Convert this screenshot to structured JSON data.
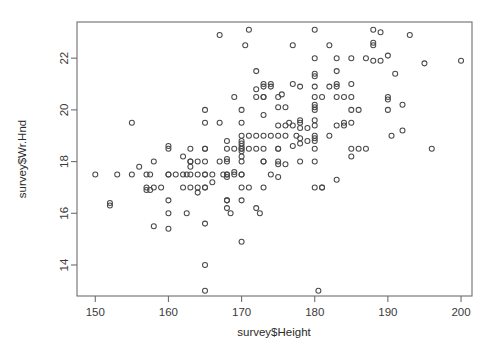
{
  "chart_data": {
    "type": "scatter",
    "title": "",
    "xlabel": "survey$Height",
    "ylabel": "survey$Wr.Hnd",
    "xlim": [
      147.5,
      201.5
    ],
    "ylim": [
      12.8,
      23.4
    ],
    "xticks": [
      150,
      160,
      170,
      180,
      190,
      200
    ],
    "yticks": [
      14,
      16,
      18,
      20,
      22
    ],
    "xtick_labels": [
      "150",
      "160",
      "170",
      "180",
      "190",
      "200"
    ],
    "ytick_labels": [
      "14",
      "16",
      "18",
      "20",
      "22"
    ],
    "grid": false,
    "legend": false,
    "marker": "open-circle",
    "marker_size_px": 5.0,
    "marker_color": "#4a4a4a",
    "n_points": 206,
    "x": [
      150.0,
      152.0,
      152.0,
      153.0,
      155.0,
      155.0,
      156.0,
      157.0,
      157.0,
      157.0,
      157.5,
      157.5,
      158.0,
      158.0,
      158.0,
      159.0,
      160.0,
      160.0,
      160.0,
      160.0,
      160.0,
      160.0,
      160.0,
      161.0,
      162.0,
      162.0,
      162.0,
      162.5,
      162.5,
      163.0,
      163.0,
      163.0,
      163.0,
      163.0,
      163.0,
      164.0,
      164.0,
      164.0,
      164.0,
      165.0,
      165.0,
      165.0,
      165.0,
      165.0,
      165.0,
      165.0,
      165.0,
      165.0,
      165.0,
      165.0,
      165.0,
      166.0,
      166.0,
      167.0,
      167.0,
      167.0,
      167.5,
      168.0,
      168.0,
      168.0,
      168.0,
      168.0,
      168.0,
      168.0,
      168.0,
      168.0,
      168.0,
      168.5,
      169.0,
      169.0,
      169.0,
      169.0,
      170.0,
      170.0,
      170.0,
      170.0,
      170.0,
      170.0,
      170.0,
      170.0,
      170.0,
      170.0,
      170.0,
      170.0,
      170.0,
      170.0,
      170.0,
      170.0,
      170.5,
      171.0,
      171.0,
      171.0,
      171.0,
      172.0,
      172.0,
      172.0,
      172.0,
      172.0,
      172.5,
      173.0,
      173.0,
      173.0,
      173.0,
      173.0,
      173.0,
      173.0,
      173.0,
      173.0,
      173.0,
      174.0,
      174.0,
      174.0,
      175.0,
      175.0,
      175.0,
      175.0,
      175.0,
      175.0,
      175.0,
      175.0,
      175.0,
      175.5,
      176.0,
      176.0,
      176.0,
      176.5,
      177.0,
      177.0,
      177.0,
      177.0,
      177.5,
      178.0,
      178.0,
      178.0,
      178.0,
      178.0,
      178.0,
      179.0,
      179.0,
      180.0,
      180.0,
      180.0,
      180.0,
      180.0,
      180.0,
      180.0,
      180.0,
      180.0,
      180.0,
      180.0,
      180.0,
      180.0,
      180.0,
      180.0,
      180.0,
      180.0,
      180.5,
      181.0,
      181.0,
      182.0,
      182.0,
      182.0,
      183.0,
      183.0,
      183.0,
      183.0,
      183.0,
      183.0,
      183.0,
      184.0,
      184.0,
      184.0,
      185.0,
      185.0,
      185.0,
      185.0,
      185.0,
      185.0,
      185.0,
      186.0,
      186.0,
      187.0,
      187.0,
      188.0,
      188.0,
      188.0,
      188.0,
      189.0,
      189.0,
      190.0,
      190.0,
      190.0,
      190.0,
      190.5,
      191.0,
      192.0,
      192.0,
      193.0,
      195.0,
      196.0,
      200.0,
      172.0,
      174.0,
      176.0,
      178.0,
      181.0
    ],
    "y": [
      17.5,
      16.3,
      16.4,
      17.5,
      19.5,
      17.5,
      17.8,
      17.5,
      17.0,
      16.9,
      17.5,
      16.9,
      15.5,
      18.0,
      17.0,
      17.0,
      16.5,
      17.5,
      17.5,
      16.0,
      18.5,
      18.6,
      15.4,
      17.5,
      17.5,
      18.2,
      17.0,
      17.5,
      16.0,
      18.0,
      18.5,
      17.5,
      17.0,
      18.0,
      17.8,
      18.0,
      17.5,
      16.8,
      17.0,
      20.0,
      19.5,
      18.5,
      18.0,
      17.5,
      17.5,
      17.0,
      15.6,
      14.0,
      13.0,
      17.0,
      18.5,
      17.2,
      17.5,
      19.5,
      18.0,
      22.9,
      17.5,
      18.8,
      18.5,
      18.0,
      17.5,
      17.5,
      16.5,
      16.5,
      16.2,
      18.1,
      17.4,
      16.0,
      20.5,
      18.5,
      17.6,
      17.5,
      20.0,
      19.5,
      19.0,
      18.8,
      18.7,
      18.6,
      18.5,
      18.5,
      18.4,
      18.2,
      18.0,
      17.5,
      17.5,
      17.0,
      16.5,
      14.9,
      22.5,
      23.1,
      19.0,
      18.5,
      17.0,
      21.5,
      20.8,
      19.0,
      18.5,
      16.2,
      16.0,
      21.0,
      20.9,
      20.5,
      20.5,
      19.8,
      19.0,
      18.5,
      18.0,
      18.0,
      17.0,
      21.0,
      20.9,
      19.0,
      20.5,
      20.1,
      19.4,
      19.0,
      18.5,
      18.5,
      18.0,
      17.9,
      17.4,
      20.6,
      20.1,
      19.4,
      19.0,
      19.5,
      22.5,
      21.0,
      19.4,
      18.6,
      19.0,
      20.9,
      19.6,
      19.5,
      18.9,
      18.7,
      18.0,
      19.3,
      18.8,
      23.1,
      22.0,
      21.4,
      21.3,
      20.9,
      20.5,
      20.2,
      20.1,
      20.0,
      19.6,
      19.4,
      19.0,
      18.9,
      18.8,
      18.5,
      18.0,
      17.0,
      13.0,
      20.5,
      17.0,
      22.5,
      20.9,
      19.0,
      22.0,
      21.5,
      21.0,
      20.9,
      20.5,
      19.4,
      17.3,
      19.4,
      19.5,
      20.5,
      22.0,
      21.0,
      20.5,
      20.0,
      19.5,
      18.5,
      18.2,
      18.5,
      20.0,
      22.0,
      18.5,
      23.1,
      22.6,
      22.5,
      21.9,
      23.0,
      21.9,
      22.1,
      20.5,
      20.4,
      20.0,
      19.0,
      21.4,
      20.2,
      19.2,
      22.9,
      21.8,
      18.5,
      21.9,
      20.5,
      17.5,
      17.9,
      19.3,
      17.0
    ]
  }
}
